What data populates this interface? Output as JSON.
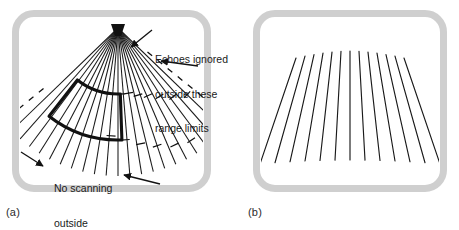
{
  "figure": {
    "background_color": "#ffffff",
    "frame_color": "#cfcfcf",
    "ink_color": "#1a1a1a"
  },
  "panels": [
    {
      "id": "a",
      "caption": "(a)",
      "kind": "sector-scan-converging-fan",
      "scan": {
        "apex": {
          "x": 118,
          "y": 28
        },
        "line_count": 21,
        "half_angle_deg": 46,
        "radius": 148
      },
      "range_gate": {
        "style": "bold-outline-sector",
        "inner_radius": 66,
        "outer_radius": 112,
        "start_angle_deg": -38,
        "end_angle_deg": 2
      },
      "limit_markers": {
        "style": "dashed-arc-and-ticks",
        "description": "short dashes and tick marks crossing the radial scan lines marking range limits"
      },
      "annotations": [
        {
          "name": "echoes-ignored",
          "lines": [
            "Echoes ignored",
            "outside these",
            "range limits"
          ],
          "arrows": 2
        },
        {
          "name": "no-scanning",
          "lines": [
            "No scanning",
            "outside",
            "these limits"
          ],
          "arrows": 2
        }
      ]
    },
    {
      "id": "b",
      "caption": "(b)",
      "kind": "diverging-linear-fan",
      "scan": {
        "line_count": 13,
        "top_span_px": 108,
        "bottom_span_px": 180,
        "top_y": 58,
        "bottom_y": 160,
        "center_x": 350,
        "top_arc_rise_px": 7
      },
      "annotations": []
    }
  ],
  "text": {
    "caption_a": "(a)",
    "caption_b": "(b)",
    "echoes_line1": "Echoes ignored",
    "echoes_line2": "outside these",
    "echoes_line3": "range limits",
    "noscan_line1": "No scanning",
    "noscan_line2": "outside",
    "noscan_line3": "these limits"
  }
}
